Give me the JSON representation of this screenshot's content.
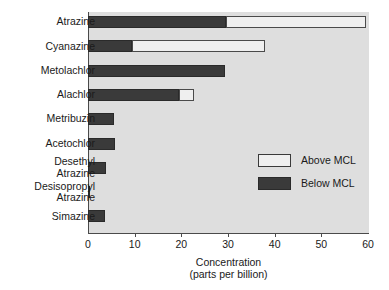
{
  "chart_data": {
    "type": "bar",
    "orientation": "horizontal",
    "stacked": true,
    "title": "",
    "xlabel": "Concentration",
    "xlabel_line2": "(parts per billion)",
    "ylabel": "",
    "xlim": [
      0,
      60
    ],
    "xticks": [
      0,
      10,
      20,
      30,
      40,
      50,
      60
    ],
    "xtick_labels": [
      "0",
      "10",
      "20",
      "30",
      "40",
      "50",
      "60"
    ],
    "grid": false,
    "legend_position": "center-right",
    "categories": [
      "Atrazine",
      "Cyanazine",
      "Metolachlor",
      "Alachlor",
      "Metribuzin",
      "Acetochlor",
      "Desethyl\nAtrazine",
      "Desisopropyl\nAtrazine",
      "Simazine"
    ],
    "series": [
      {
        "name": "Below MCL",
        "color": "#3a3a3a",
        "values": [
          29.5,
          9.5,
          29.4,
          19.6,
          5.5,
          5.8,
          3.8,
          0.5,
          3.7
        ]
      },
      {
        "name": "Above MCL",
        "color": "#efefef",
        "values": [
          30.1,
          28.5,
          0,
          3.2,
          0,
          0,
          0,
          0,
          0
        ]
      }
    ],
    "totals": [
      59.6,
      38.0,
      29.4,
      22.8,
      5.5,
      5.8,
      3.8,
      0.5,
      3.7
    ]
  },
  "legend": {
    "items": [
      {
        "label": "Above MCL",
        "swatch": "above"
      },
      {
        "label": "Below MCL",
        "swatch": "below"
      }
    ]
  },
  "colors": {
    "plot_background": "#dedede",
    "axis": "#4a4a4a",
    "below_mcl": "#3a3a3a",
    "above_mcl": "#efefef",
    "text": "#1a1a1a"
  }
}
